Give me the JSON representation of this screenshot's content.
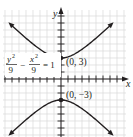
{
  "graph": {
    "equation": {
      "numerator_left": "y",
      "exp_left": "2",
      "denominator_left": "9",
      "minus": "−",
      "numerator_right": "x",
      "exp_right": "2",
      "denominator_right": "9",
      "equals": "= 1"
    },
    "axes": {
      "x_label": "x",
      "y_label": "y"
    },
    "vertices": [
      {
        "label": "(0, 3)",
        "x": 0,
        "y": 3
      },
      {
        "label": "(0, −3)",
        "x": 0,
        "y": -3
      }
    ],
    "curve": {
      "type": "hyperbola",
      "a": 3,
      "b": 3,
      "orientation": "vertical"
    },
    "colors": {
      "curve": "#231f20",
      "grid": "#d9d9d9",
      "axis": "#231f20"
    }
  }
}
